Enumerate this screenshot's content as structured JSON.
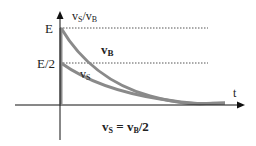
{
  "diagram": {
    "y_axis_label": {
      "main1": "v",
      "sub1": "S",
      "slash": "/",
      "main2": "v",
      "sub2": "B"
    },
    "x_axis_label": "t",
    "tick_E": "E",
    "tick_E2": "E/2",
    "curve_vB_label": {
      "main": "v",
      "sub": "B"
    },
    "curve_vS_label": {
      "main": "v",
      "sub": "S"
    },
    "equation": {
      "lhs_main": "v",
      "lhs_sub": "S",
      "eq": " = ",
      "rhs_main": "v",
      "rhs_sub": "B",
      "rhs_tail": "/2"
    },
    "colors": {
      "curve": "#8a8a8a",
      "axis": "#111111",
      "dotted": "#555555"
    }
  }
}
